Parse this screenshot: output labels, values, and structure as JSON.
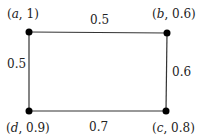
{
  "diagram": {
    "type": "graph",
    "colors": {
      "edge": "#333333",
      "node": "#000000",
      "text": "#222222"
    },
    "nodes": [
      {
        "id": "a",
        "label_var": "a",
        "label_val": "1",
        "x": 29,
        "y": 32
      },
      {
        "id": "b",
        "label_var": "b",
        "label_val": "0.6",
        "x": 167,
        "y": 33
      },
      {
        "id": "c",
        "label_var": "c",
        "label_val": "0.8",
        "x": 166,
        "y": 111
      },
      {
        "id": "d",
        "label_var": "d",
        "label_val": "0.9",
        "x": 29,
        "y": 111
      }
    ],
    "edges": [
      {
        "from": "a",
        "to": "b",
        "weight": "0.5"
      },
      {
        "from": "b",
        "to": "c",
        "weight": "0.6"
      },
      {
        "from": "c",
        "to": "d",
        "weight": "0.7"
      },
      {
        "from": "d",
        "to": "a",
        "weight": "0.5"
      }
    ]
  }
}
